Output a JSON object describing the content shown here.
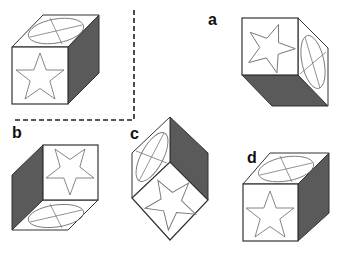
{
  "figure": {
    "reference_cube": {
      "name": "reference",
      "faces": {
        "front": "star",
        "top": "ellipse-cross",
        "right": "shaded"
      }
    },
    "options": [
      {
        "label": "a",
        "faces": {
          "front": "star",
          "right": "ellipse-cross",
          "bottom": "shaded"
        }
      },
      {
        "label": "b",
        "faces": {
          "front": "star",
          "left": "shaded",
          "bottom": "ellipse-cross"
        }
      },
      {
        "label": "c",
        "faces": {
          "left": "ellipse-cross",
          "right": "shaded",
          "bottom": "star"
        }
      },
      {
        "label": "d",
        "faces": {
          "front": "star",
          "top": "ellipse-cross",
          "right": "shaded"
        }
      }
    ],
    "colors": {
      "shade": "#555555",
      "line": "#333333",
      "symbol": "#777777",
      "background": "#ffffff"
    }
  }
}
